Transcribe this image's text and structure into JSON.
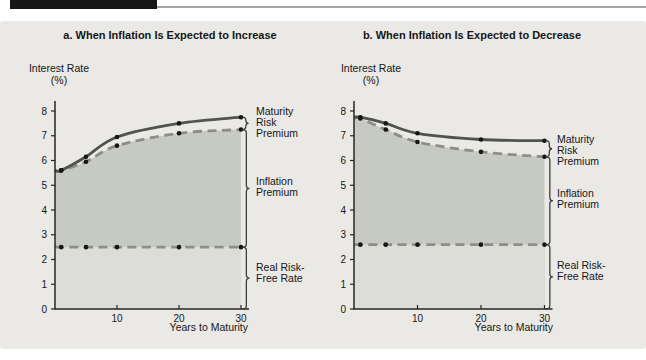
{
  "colors": {
    "top_bar": "#161616",
    "top_rule": "#a6a6a6",
    "panel_bg": "#eae9e6",
    "fill_upper": "#c7c9c3",
    "fill_lower": "#dcddd8",
    "line_solid": "#50544d",
    "line_dashed": "#8b8f88",
    "dot": "#161616",
    "axis": "#262626",
    "text": "#161616",
    "brace": "#3c3f3a"
  },
  "chart_data": [
    {
      "type": "line",
      "title": "a. When Inflation Is Expected to Increase",
      "ylabel": "Interest Rate",
      "ylabel_unit": "(%)",
      "xlabel": "Years to Maturity",
      "x": [
        1,
        5,
        10,
        20,
        30
      ],
      "xticks": [
        10,
        20,
        30
      ],
      "yticks": [
        0,
        1,
        2,
        3,
        4,
        5,
        6,
        7,
        8
      ],
      "ylim": [
        0,
        8
      ],
      "xlim": [
        0,
        30
      ],
      "grid": false,
      "legend": "none",
      "series": [
        {
          "name": "nominal-interest-rate-with-maturity-risk-premium",
          "style": "solid",
          "values": [
            5.6,
            6.15,
            6.95,
            7.5,
            7.75
          ]
        },
        {
          "name": "real-rate-plus-inflation-premium",
          "style": "dashed",
          "values": [
            5.6,
            5.95,
            6.6,
            7.1,
            7.25
          ]
        },
        {
          "name": "real-risk-free-rate",
          "style": "dashed",
          "values": [
            2.5,
            2.5,
            2.5,
            2.5,
            2.5
          ]
        }
      ],
      "annotations": {
        "maturity_risk_premium": [
          "Maturity",
          "Risk",
          "Premium"
        ],
        "inflation_premium": [
          "Inflation",
          "Premium"
        ],
        "real_risk_free_rate": [
          "Real Risk-",
          "Free Rate"
        ]
      }
    },
    {
      "type": "line",
      "title": "b. When Inflation Is Expected to Decrease",
      "ylabel": "Interest Rate",
      "ylabel_unit": "(%)",
      "xlabel": "Years to Maturity",
      "x": [
        1,
        5,
        10,
        20,
        30
      ],
      "xticks": [
        10,
        20,
        30
      ],
      "yticks": [
        0,
        1,
        2,
        3,
        4,
        5,
        6,
        7,
        8
      ],
      "ylim": [
        0,
        8
      ],
      "xlim": [
        0,
        30
      ],
      "grid": false,
      "legend": "none",
      "series": [
        {
          "name": "nominal-interest-rate-with-maturity-risk-premium",
          "style": "solid",
          "values": [
            7.75,
            7.5,
            7.1,
            6.85,
            6.8
          ]
        },
        {
          "name": "real-rate-plus-inflation-premium",
          "style": "dashed",
          "values": [
            7.7,
            7.25,
            6.75,
            6.35,
            6.15
          ]
        },
        {
          "name": "real-risk-free-rate",
          "style": "dashed",
          "values": [
            2.6,
            2.6,
            2.6,
            2.6,
            2.6
          ]
        }
      ],
      "annotations": {
        "maturity_risk_premium": [
          "Maturity",
          "Risk",
          "Premium"
        ],
        "inflation_premium": [
          "Inflation",
          "Premium"
        ],
        "real_risk_free_rate": [
          "Real Risk-",
          "Free Rate"
        ]
      }
    }
  ]
}
